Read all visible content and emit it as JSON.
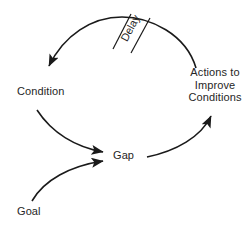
{
  "diagram": {
    "background_color": "#ffffff",
    "stroke_color": "#1a1a1a",
    "text_color": "#262626",
    "nodes": {
      "condition": "Condition",
      "actions": "Actions to Improve Conditions",
      "actions_line1": "Actions to",
      "actions_line2": "Improve",
      "actions_line3": "Conditions",
      "gap": "Gap",
      "goal": "Goal"
    },
    "annotations": {
      "delay": "Delay"
    },
    "edges": [
      {
        "from": "Actions to Improve Conditions",
        "to": "Condition",
        "marker": "Delay"
      },
      {
        "from": "Condition",
        "to": "Gap",
        "marker": ""
      },
      {
        "from": "Goal",
        "to": "Gap",
        "marker": ""
      },
      {
        "from": "Gap",
        "to": "Actions to Improve Conditions",
        "marker": ""
      }
    ]
  }
}
